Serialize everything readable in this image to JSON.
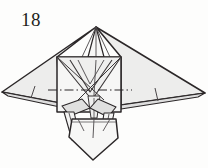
{
  "figure": {
    "step_number": "18",
    "caption": "",
    "kind": "origami-step-diagram",
    "canvas": {
      "width": 208,
      "height": 168
    },
    "colors": {
      "background": "#fdfdfc",
      "paper_front": "#ececeb",
      "paper_shade": "#e2e2e1",
      "paper_shade_dark": "#d6d6d5",
      "paper_white": "#fafafa",
      "ink": "#231f20",
      "ink_soft": "#4a4648",
      "crease": "#5c585a"
    },
    "parts": {
      "left_wing": "left-wing-panel",
      "right_wing": "right-wing-panel",
      "body": "central-body-panel",
      "head_spike": "top-apex-spike",
      "tail": "lower-tail-panel",
      "left_flap": "left-side-flap",
      "right_flap": "right-side-flap",
      "left_leg": "left-leg-flap",
      "right_leg": "right-leg-flap",
      "fold_line": "horizontal-dash-dot-fold-line"
    },
    "geometry": {
      "apex": [
        96,
        27
      ],
      "left_wing_tip": [
        2,
        92
      ],
      "right_wing_tip": [
        205,
        93
      ],
      "body_left": 57,
      "body_right": 121,
      "body_top": 57,
      "body_bottom": 112,
      "tail_point": [
        93,
        160
      ],
      "fold_line_y": 90
    }
  }
}
